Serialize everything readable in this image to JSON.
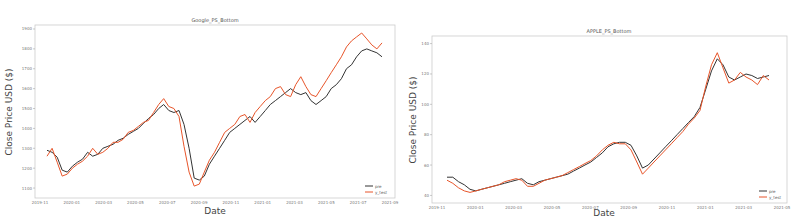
{
  "chart_data": [
    {
      "type": "line",
      "title": "Google_PS_Bottom",
      "xlabel": "Date",
      "ylabel": "Close Price USD ($)",
      "legend": {
        "position": "lower right",
        "entries": [
          "pre",
          "y_test"
        ]
      },
      "x_ticks": [
        "2019-11",
        "2020-01",
        "2020-03",
        "2020-05",
        "2020-07",
        "2020-09",
        "2020-11",
        "2021-01",
        "2021-03",
        "2021-05",
        "2021-07",
        "2021-09"
      ],
      "y_ticks": [
        1100,
        1200,
        1300,
        1400,
        1500,
        1600,
        1700,
        1800,
        1900
      ],
      "ylim": [
        1050,
        1920
      ],
      "grid": false,
      "series": [
        {
          "name": "pre",
          "color": "#333333",
          "values": [
            1290,
            1280,
            1255,
            1190,
            1180,
            1210,
            1230,
            1245,
            1280,
            1260,
            1270,
            1300,
            1310,
            1320,
            1340,
            1350,
            1370,
            1385,
            1400,
            1425,
            1450,
            1470,
            1500,
            1520,
            1490,
            1480,
            1490,
            1420,
            1300,
            1150,
            1140,
            1160,
            1220,
            1260,
            1300,
            1340,
            1380,
            1400,
            1420,
            1440,
            1460,
            1430,
            1460,
            1490,
            1520,
            1540,
            1560,
            1580,
            1600,
            1580,
            1570,
            1580,
            1540,
            1520,
            1540,
            1560,
            1600,
            1620,
            1650,
            1700,
            1720,
            1760,
            1790,
            1800,
            1790,
            1780,
            1760
          ]
        },
        {
          "name": "y_test",
          "color": "#e8552a",
          "values": [
            1260,
            1300,
            1230,
            1160,
            1170,
            1200,
            1220,
            1235,
            1260,
            1300,
            1270,
            1280,
            1300,
            1330,
            1330,
            1345,
            1380,
            1390,
            1410,
            1430,
            1440,
            1480,
            1520,
            1550,
            1510,
            1500,
            1460,
            1310,
            1180,
            1110,
            1120,
            1180,
            1240,
            1280,
            1330,
            1380,
            1400,
            1420,
            1460,
            1470,
            1430,
            1480,
            1510,
            1540,
            1560,
            1600,
            1610,
            1570,
            1560,
            1620,
            1660,
            1610,
            1570,
            1560,
            1600,
            1640,
            1680,
            1720,
            1760,
            1810,
            1840,
            1860,
            1880,
            1850,
            1820,
            1800,
            1830
          ]
        }
      ]
    },
    {
      "type": "line",
      "title": "APPLE_PS_Bottom",
      "xlabel": "Date",
      "ylabel": "Close Price USD ($)",
      "legend": {
        "position": "lower right",
        "entries": [
          "pre",
          "y_test"
        ]
      },
      "x_ticks": [
        "2019-11",
        "2020-01",
        "2020-03",
        "2020-05",
        "2020-07",
        "2020-09",
        "2020-11",
        "2021-01",
        "2021-03",
        "2021-05"
      ],
      "y_ticks": [
        40,
        60,
        80,
        100,
        120,
        140
      ],
      "ylim": [
        35,
        145
      ],
      "grid": false,
      "series": [
        {
          "name": "pre",
          "color": "#333333",
          "values": [
            52,
            52,
            49,
            47,
            44,
            43,
            44,
            45,
            46,
            47,
            48,
            49,
            50,
            51,
            48,
            47,
            49,
            50,
            51,
            52,
            53,
            54,
            56,
            58,
            60,
            62,
            65,
            68,
            72,
            74,
            75,
            75,
            73,
            66,
            58,
            60,
            64,
            68,
            72,
            76,
            80,
            84,
            88,
            92,
            98,
            110,
            122,
            130,
            126,
            118,
            116,
            118,
            120,
            119,
            117,
            118,
            119
          ]
        },
        {
          "name": "y_test",
          "color": "#e8552a",
          "values": [
            50,
            48,
            45,
            43,
            42,
            43,
            44,
            45,
            46,
            47,
            49,
            50,
            51,
            50,
            46,
            46,
            48,
            50,
            51,
            52,
            53,
            55,
            57,
            59,
            61,
            63,
            66,
            70,
            73,
            75,
            74,
            74,
            70,
            62,
            54,
            58,
            62,
            66,
            70,
            74,
            78,
            82,
            87,
            91,
            96,
            112,
            126,
            134,
            124,
            114,
            116,
            121,
            118,
            116,
            113,
            119,
            116
          ]
        }
      ]
    }
  ]
}
